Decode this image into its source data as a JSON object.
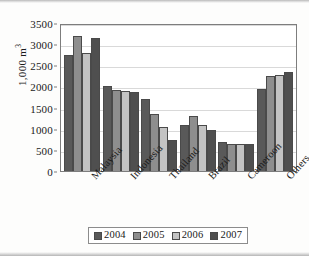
{
  "chart_data": {
    "type": "bar",
    "title": "",
    "xlabel": "",
    "ylabel": "1,000 m³",
    "ylim": [
      0,
      3500
    ],
    "y_ticks": [
      0,
      500,
      1000,
      1500,
      2000,
      2500,
      3000,
      3500
    ],
    "grid": true,
    "legend_position": "bottom",
    "categories": [
      "Malaysia",
      "Indonesia",
      "Thailand",
      "Brazil",
      "Cameroon",
      "Others"
    ],
    "series": [
      {
        "name": "2004",
        "color": "#595959",
        "values": [
          2750,
          2000,
          1700,
          1080,
          680,
          1950
        ]
      },
      {
        "name": "2005",
        "color": "#8e8e8e",
        "values": [
          3200,
          1920,
          1360,
          1300,
          650,
          2250
        ]
      },
      {
        "name": "2006",
        "color": "#c3c3c3",
        "values": [
          2790,
          1890,
          1050,
          1080,
          650,
          2270
        ]
      },
      {
        "name": "2007",
        "color": "#4f4f4f",
        "values": [
          3140,
          1860,
          740,
          970,
          650,
          2340
        ]
      }
    ]
  }
}
